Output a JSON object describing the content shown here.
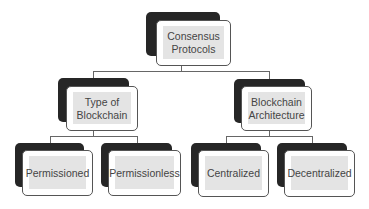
{
  "diagram": {
    "type": "hierarchy-tree",
    "root": {
      "label": "Consensus\nProtocols",
      "children": [
        {
          "label": "Type of\nBlockchain",
          "children": [
            {
              "label": "Permissioned"
            },
            {
              "label": "Permissionless"
            }
          ]
        },
        {
          "label": "Blockchain\nArchitecture",
          "children": [
            {
              "label": "Centralized"
            },
            {
              "label": "Decentralized"
            }
          ]
        }
      ]
    }
  },
  "nodes": {
    "consensus_protocols": "Consensus\nProtocols",
    "type_of_blockchain": "Type of\nBlockchain",
    "blockchain_architecture": "Blockchain\nArchitecture",
    "permissioned": "Permissioned",
    "permissionless": "Permissionless",
    "centralized": "Centralized",
    "decentralized": "Decentralized"
  },
  "colors": {
    "shadow_box": "#262626",
    "box_fill": "#e4e4e4",
    "box_border": "#555555",
    "text": "#444444",
    "connector": "#666666"
  }
}
